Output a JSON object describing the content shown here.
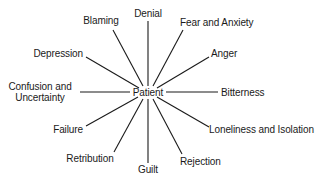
{
  "diagram": {
    "center": "Patient",
    "spokes": [
      {
        "id": "denial",
        "label": "Denial"
      },
      {
        "id": "blaming",
        "label": "Blaming"
      },
      {
        "id": "fear",
        "label": "Fear and Anxiety"
      },
      {
        "id": "depression",
        "label": "Depression"
      },
      {
        "id": "anger",
        "label": "Anger"
      },
      {
        "id": "confusion",
        "label_line1": "Confusion and",
        "label_line2": "Uncertainty"
      },
      {
        "id": "bitterness",
        "label": "Bitterness"
      },
      {
        "id": "failure",
        "label": "Failure"
      },
      {
        "id": "loneliness",
        "label": "Loneliness and Isolation"
      },
      {
        "id": "retribution",
        "label": "Retribution"
      },
      {
        "id": "rejection",
        "label": "Rejection"
      },
      {
        "id": "guilt",
        "label": "Guilt"
      }
    ],
    "line_color": "#1a1a1a"
  }
}
